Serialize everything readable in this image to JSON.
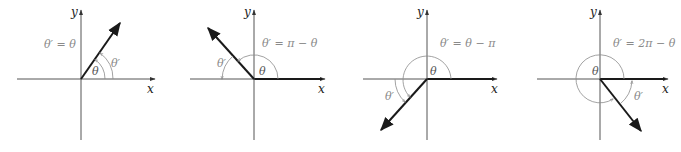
{
  "figure": {
    "colors": {
      "axis": "#555555",
      "ray": "#1a1a1a",
      "arc": "#8a8a8a",
      "label": "#8a8a8a"
    },
    "panels": [
      {
        "id": "q1",
        "x_label": "x",
        "y_label": "y",
        "theta_label": "θ",
        "ref_label": "θ′",
        "formula": "θ′ = θ"
      },
      {
        "id": "q2",
        "x_label": "x",
        "y_label": "y",
        "theta_label": "θ",
        "ref_label": "θ′",
        "formula": "θ′ = π − θ"
      },
      {
        "id": "q3",
        "x_label": "x",
        "y_label": "y",
        "theta_label": "θ",
        "ref_label": "θ′",
        "formula": "θ′ = θ − π"
      },
      {
        "id": "q4",
        "x_label": "x",
        "y_label": "y",
        "theta_label": "θ",
        "ref_label": "θ′",
        "formula": "θ′ = 2π − θ"
      }
    ]
  }
}
